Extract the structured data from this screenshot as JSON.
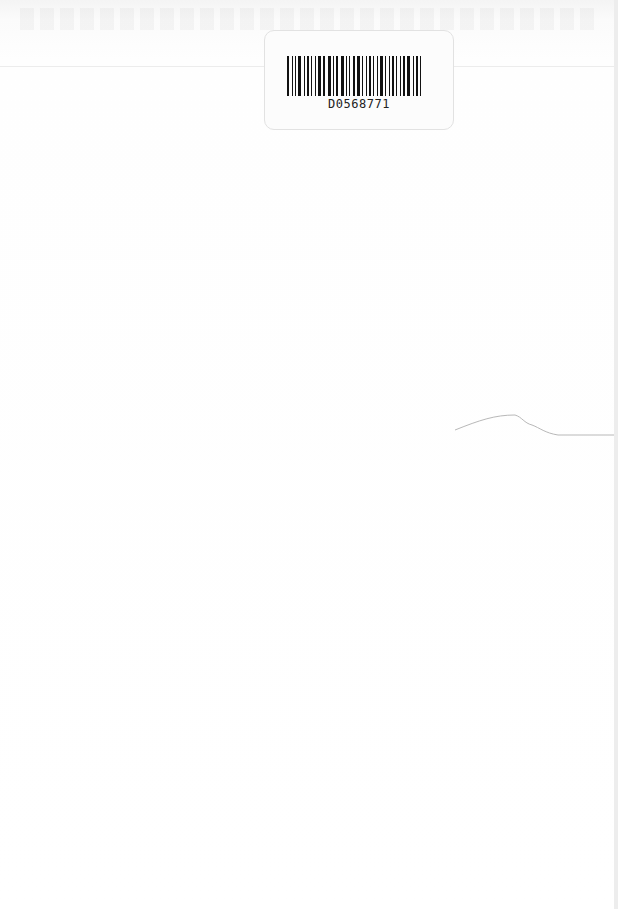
{
  "page": {
    "type": "scanned-blank-page",
    "barcode_label": {
      "code": "D0568771"
    }
  }
}
